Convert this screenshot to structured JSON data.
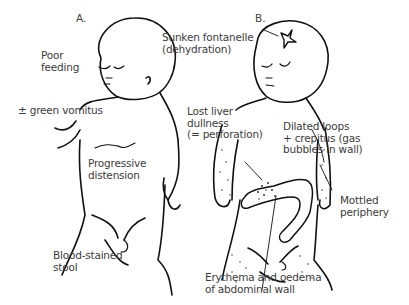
{
  "figure": {
    "panels": [
      {
        "id": "A",
        "label": "A.",
        "annotations": {
          "poor_feeding": [
            "Poor",
            "feeding"
          ],
          "green_vomitus": "± green vomitus",
          "progressive_distension": [
            "Progressive",
            "distension"
          ],
          "blood_stained_stool": [
            "Blood-stained",
            "stool"
          ]
        }
      },
      {
        "id": "B",
        "label": "B.",
        "annotations": {
          "sunken_fontanelle": [
            "Sunken fontanelle",
            "(dehydration)"
          ],
          "lost_liver_dullness": [
            "Lost liver",
            "dullness",
            "(= perforation)"
          ],
          "dilated_loops": [
            "Dilated loops",
            "+ crepitus (gas",
            "bubbles in wall)"
          ],
          "mottled_periphery": [
            "Mottled",
            "periphery"
          ],
          "erythema": [
            "Erythema and oedema",
            "of abdominal wall"
          ]
        }
      }
    ],
    "colors": {
      "line": "#111111",
      "text": "#3c3c3c",
      "background": "#ffffff"
    }
  }
}
